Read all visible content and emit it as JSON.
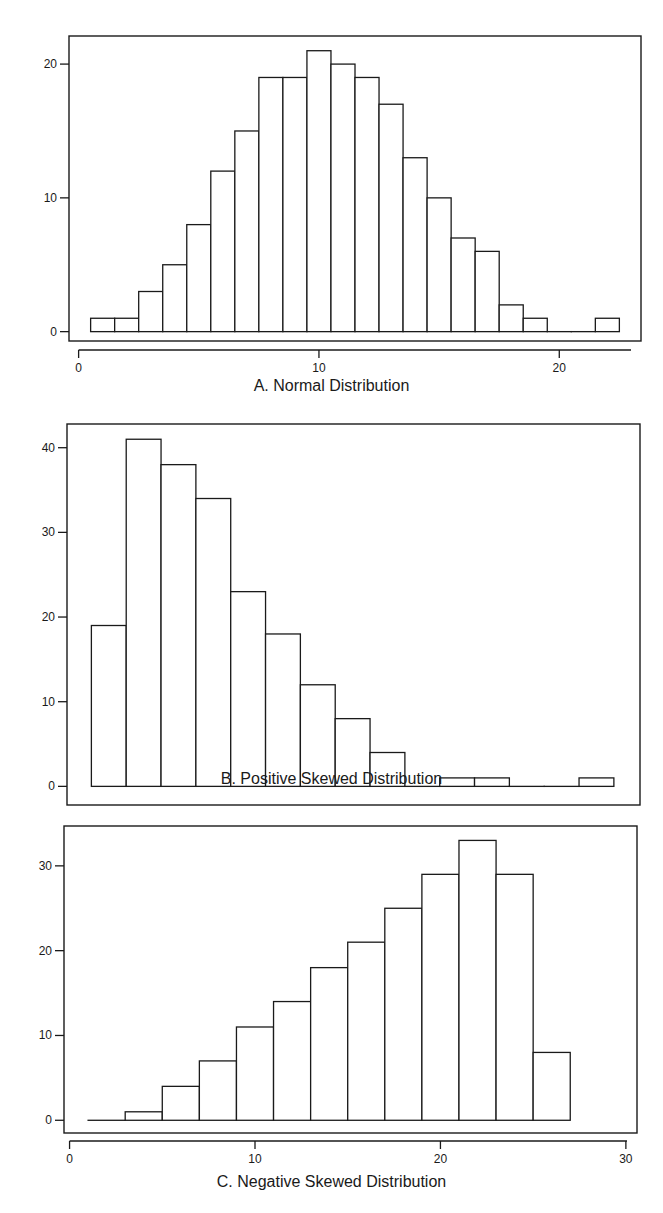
{
  "chart_data": [
    {
      "type": "bar",
      "subtype": "histogram",
      "title": "A.  Normal Distribution",
      "xlabel": "",
      "ylabel": "",
      "bin_width": 1,
      "bin_start": 0.5,
      "categories": [
        "1",
        "2",
        "3",
        "4",
        "5",
        "6",
        "7",
        "8",
        "9",
        "10",
        "11",
        "12",
        "13",
        "14",
        "15",
        "16",
        "17",
        "18",
        "19",
        "20",
        "21",
        "22"
      ],
      "values": [
        1,
        1,
        3,
        5,
        8,
        12,
        15,
        19,
        19,
        21,
        20,
        19,
        17,
        13,
        10,
        7,
        6,
        2,
        1,
        0,
        0,
        1
      ],
      "xticks": [
        0,
        10,
        20
      ],
      "yticks": [
        0,
        10,
        20
      ],
      "xlim": [
        -0.4,
        23.4
      ],
      "ylim": [
        -0.7,
        22.1
      ],
      "grid": false,
      "legend": null
    },
    {
      "type": "bar",
      "subtype": "histogram",
      "title": "B.  Positive Skewed Distribution",
      "xlabel": "",
      "ylabel": "",
      "bin_width": 2,
      "bin_start": 1,
      "categories": [
        "2",
        "4",
        "6",
        "8",
        "10",
        "12",
        "14",
        "16",
        "18",
        "20",
        "22",
        "24",
        "26",
        "28",
        "30"
      ],
      "values": [
        19,
        41,
        38,
        34,
        23,
        18,
        12,
        8,
        4,
        0,
        1,
        1,
        0,
        0,
        1
      ],
      "xticks": [
        0,
        10,
        20,
        30
      ],
      "yticks": [
        0,
        10,
        20,
        30,
        40
      ],
      "xlim": [
        -0.4,
        32.5
      ],
      "ylim": [
        -2.2,
        42.8
      ],
      "grid": false,
      "legend": null
    },
    {
      "type": "bar",
      "subtype": "histogram",
      "title": "C. Negative Skewed Distribution",
      "xlabel": "",
      "ylabel": "",
      "bin_width": 2,
      "bin_start": 1,
      "categories": [
        "2",
        "4",
        "6",
        "8",
        "10",
        "12",
        "14",
        "16",
        "18",
        "20",
        "22",
        "24",
        "26"
      ],
      "values": [
        0,
        1,
        4,
        7,
        11,
        14,
        18,
        21,
        25,
        29,
        33,
        29,
        8
      ],
      "xticks": [
        0,
        10,
        20,
        30
      ],
      "yticks": [
        0,
        10,
        20,
        30
      ],
      "xlim": [
        -0.3,
        30.6
      ],
      "ylim": [
        -1.5,
        34.7
      ],
      "grid": false,
      "legend": null
    }
  ]
}
